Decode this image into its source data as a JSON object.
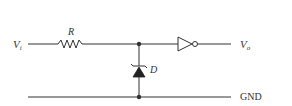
{
  "diagram": {
    "type": "circuit-schematic",
    "input": {
      "label": "V",
      "subscript": "i"
    },
    "resistor": {
      "label": "R"
    },
    "zener_diode": {
      "label": "D"
    },
    "inverter": {
      "label": ""
    },
    "output": {
      "label": "V",
      "subscript": "o"
    },
    "ground": {
      "label": "GND"
    },
    "colors": {
      "stroke": "#333333",
      "background": "#ffffff"
    },
    "connections": [
      "Vi -> R -> node_top",
      "node_top -> Zener D (cathode up) -> node_bottom",
      "node_top -> Inverter -> Vo",
      "node_bottom -> GND rail"
    ]
  }
}
